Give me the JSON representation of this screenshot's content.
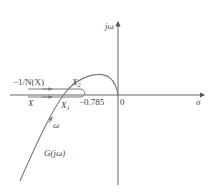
{
  "figure": {
    "type": "nyquist-describing-function-plot",
    "axes": {
      "x_label": "σ",
      "y_label": "jω",
      "origin_label": "0"
    },
    "curves": {
      "linear_part": {
        "label": "G(jω)",
        "direction_label": "ω"
      },
      "describing_function": {
        "label": "−1/N(X)",
        "direction_label": "X",
        "turning_point_label": "−0.785"
      }
    },
    "intersections": [
      {
        "label": "X",
        "subscript": "2"
      },
      {
        "label": "X",
        "subscript": "1"
      }
    ],
    "colors": {
      "axis": "#555555",
      "curve": "#7a7a7a",
      "text": "#444444"
    }
  }
}
